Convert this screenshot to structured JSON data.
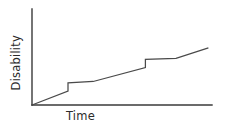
{
  "chart_data": {
    "type": "line",
    "title": "",
    "subtitle": "",
    "xlabel": "Time",
    "ylabel": "Disability",
    "grid": false,
    "legend": null,
    "xlim": [
      0,
      10
    ],
    "ylim": [
      0,
      10
    ],
    "axis_ticks": {
      "x": [],
      "y": []
    },
    "annotations": [],
    "series": [
      {
        "name": "Disability accumulation",
        "points": [
          {
            "x": 0.0,
            "y": 0.0
          },
          {
            "x": 2.0,
            "y": 1.45
          },
          {
            "x": 2.0,
            "y": 2.3
          },
          {
            "x": 3.4,
            "y": 2.45
          },
          {
            "x": 6.3,
            "y": 3.9
          },
          {
            "x": 6.3,
            "y": 4.75
          },
          {
            "x": 8.0,
            "y": 4.85
          },
          {
            "x": 9.8,
            "y": 5.95
          }
        ]
      }
    ],
    "steps": [
      {
        "x": 2.0,
        "from_y": 1.45,
        "to_y": 2.3
      },
      {
        "x": 6.3,
        "from_y": 3.9,
        "to_y": 4.75
      }
    ]
  },
  "labels": {
    "x_axis": "Time",
    "y_axis": "Disability"
  },
  "colors": {
    "background": "#ffffff",
    "axis": "#3a3a3a",
    "line": "#4a4a4a",
    "text": "#2b2b2b"
  }
}
